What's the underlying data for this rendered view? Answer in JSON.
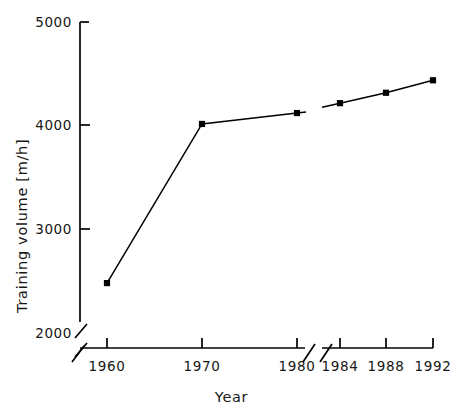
{
  "chart_data": {
    "type": "line",
    "title": "",
    "xlabel": "Year",
    "ylabel": "Training volume [m/h]",
    "x": [
      1960,
      1970,
      1980,
      1984,
      1988,
      1992
    ],
    "values": [
      2480,
      4010,
      4115,
      4210,
      4310,
      4430
    ],
    "series": [
      {
        "name": "Training volume",
        "values": [
          2480,
          4010,
          4115,
          4210,
          4310,
          4430
        ]
      }
    ],
    "xtick_labels": [
      "1960",
      "1970",
      "1980",
      "1984",
      "1988",
      "1992"
    ],
    "ytick_labels": [
      "2000",
      "3000",
      "4000",
      "5000"
    ],
    "ytick_values": [
      2000,
      3000,
      4000,
      5000
    ],
    "ylim": [
      2000,
      5000
    ],
    "xlim": [
      1957,
      1993
    ],
    "grid": false,
    "legend": false,
    "legend_position": "none",
    "marker": "square",
    "marker_color": "#000000",
    "line_color": "#000000",
    "axis_color": "#000000",
    "background_color": "#ffffff",
    "axis_breaks": {
      "y_axis_break_after": "2000",
      "x_axis_break_between": [
        "1980",
        "1984"
      ],
      "x_axis_break_before": "1960",
      "note": "broken axis slashes on y-axis below 2000, on x-axis left of 1960 and between 1980 and 1984"
    },
    "annotations": []
  },
  "axis": {
    "y_label": "Training volume [m/h]",
    "x_label": "Year",
    "y_ticks": [
      {
        "label": "5000",
        "y": 22
      },
      {
        "label": "4000",
        "y": 125
      },
      {
        "label": "3000",
        "y": 229
      },
      {
        "label": "2000",
        "y": 333
      }
    ],
    "x_ticks": [
      {
        "label": "1960",
        "x": 107
      },
      {
        "label": "1970",
        "x": 202
      },
      {
        "label": "1980",
        "x": 297
      },
      {
        "label": "1984",
        "x": 340
      },
      {
        "label": "1988",
        "x": 386
      },
      {
        "label": "1992",
        "x": 433
      }
    ]
  }
}
